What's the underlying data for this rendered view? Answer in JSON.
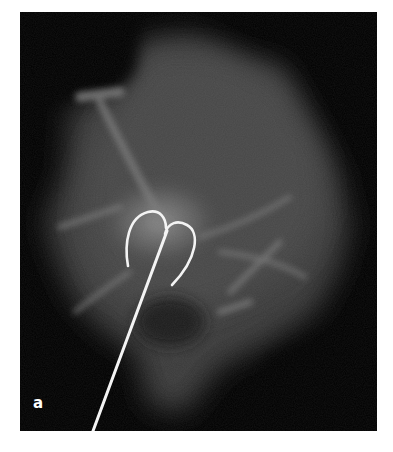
{
  "figure": {
    "panel_label": "a",
    "background_color": "#000000",
    "wire_color": "#f4f4f4"
  }
}
